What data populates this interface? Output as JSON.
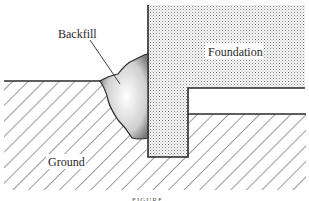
{
  "diagram": {
    "labels": {
      "backfill": "Backfill",
      "foundation": "Foundation",
      "ground": "Ground"
    },
    "caption": "FIGURE",
    "colors": {
      "line": "#2a2a2a",
      "hatch": "#3a3a3a",
      "stipple": "#8a8a8a",
      "background": "#ffffff"
    }
  }
}
